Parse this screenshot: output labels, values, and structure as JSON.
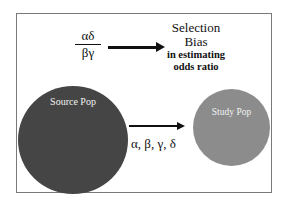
{
  "diagram": {
    "fraction": {
      "numerator": "αδ",
      "denominator": "βγ"
    },
    "outcome": {
      "line1": "Selection",
      "line2": "Bias",
      "line3": "in estimating",
      "line4": "odds ratio"
    },
    "source_population": {
      "label": "Source Pop",
      "color": "#454545"
    },
    "study_population": {
      "label": "Study Pop",
      "color": "#8c8c8c"
    },
    "selection_probabilities": "α, β, γ, δ",
    "edges": [
      {
        "from": "fraction",
        "to": "outcome",
        "type": "arrow"
      },
      {
        "from": "source_population",
        "to": "study_population",
        "type": "arrow",
        "label": "α, β, γ, δ"
      }
    ]
  }
}
